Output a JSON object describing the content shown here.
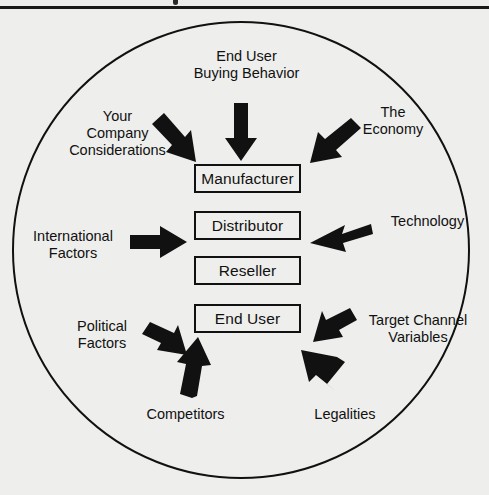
{
  "page": {
    "background_color": "#eeeeec",
    "ink_color": "#111111",
    "top_rule_color": "#1a1a1a",
    "cut_off_heading_fragment": ""
  },
  "diagram": {
    "type": "influence-diagram",
    "shape": "circle",
    "circle": {
      "cx": 241,
      "cy": 250,
      "r": 228,
      "stroke": "#111111",
      "stroke_width": 2
    },
    "chain_title": "Distribution Channel",
    "nodes": [
      {
        "id": "manufacturer",
        "label": "Manufacturer",
        "x": 194,
        "y": 164,
        "w": 107,
        "h": 29
      },
      {
        "id": "distributor",
        "label": "Distributor",
        "x": 194,
        "y": 211,
        "w": 107,
        "h": 29
      },
      {
        "id": "reseller",
        "label": "Reseller",
        "x": 194,
        "y": 256,
        "w": 107,
        "h": 29
      },
      {
        "id": "end-user",
        "label": "End User",
        "x": 194,
        "y": 304,
        "w": 107,
        "h": 29
      }
    ],
    "influences": [
      {
        "id": "end-user-buying-behavior",
        "label": "End User\nBuying Behavior",
        "target": "manufacturer",
        "arrow_direction": "down",
        "label_x": 184,
        "label_y": 48,
        "label_w": 125
      },
      {
        "id": "your-company-considerations",
        "label": "Your\nCompany\nConsiderations",
        "target": "manufacturer",
        "arrow_direction": "down-right",
        "label_x": 60,
        "label_y": 108,
        "label_w": 115
      },
      {
        "id": "the-economy",
        "label": "The\nEconomy",
        "target": "manufacturer",
        "arrow_direction": "down-left",
        "label_x": 348,
        "label_y": 104,
        "label_w": 90
      },
      {
        "id": "international-factors",
        "label": "International\nFactors",
        "target": "distributor",
        "arrow_direction": "right",
        "label_x": 22,
        "label_y": 228,
        "label_w": 102
      },
      {
        "id": "technology",
        "label": "Technology",
        "target": "distributor",
        "arrow_direction": "left",
        "label_x": 380,
        "label_y": 213,
        "label_w": 95
      },
      {
        "id": "political-factors",
        "label": "Political\nFactors",
        "target": "end-user",
        "arrow_direction": "up-right",
        "label_x": 58,
        "label_y": 318,
        "label_w": 88
      },
      {
        "id": "target-channel-variables",
        "label": "Target Channel\nVariables",
        "target": "end-user",
        "arrow_direction": "up-left",
        "label_x": 358,
        "label_y": 312,
        "label_w": 120
      },
      {
        "id": "competitors",
        "label": "Competitors",
        "target": "end-user",
        "arrow_direction": "up",
        "label_x": 133,
        "label_y": 406,
        "label_w": 105
      },
      {
        "id": "legalities",
        "label": "Legalities",
        "target": "end-user",
        "arrow_direction": "up-left",
        "label_x": 300,
        "label_y": 406,
        "label_w": 90
      }
    ]
  }
}
